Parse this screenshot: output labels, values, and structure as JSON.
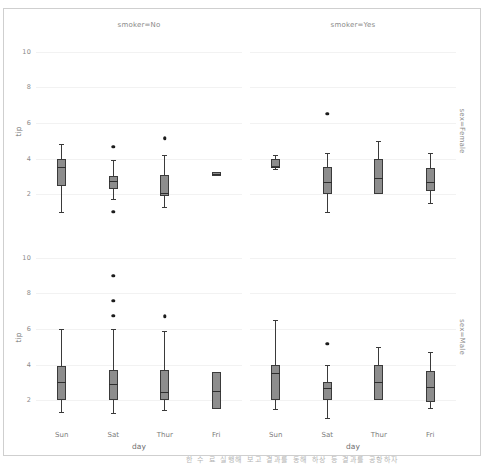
{
  "figure": {
    "background_color": "#ffffff",
    "frame_color": "#cfcfcf",
    "grid_color": "#f2f2f2",
    "box_fill_color": "#8d8d8d",
    "box_edge_color": "#3a3a3a",
    "flier_color": "#1c1c1c",
    "bottom_caption": "한 수 료 실행해 보고 결과를 동해 하상 등 결과를 공항하자"
  },
  "axis": {
    "ylabel": "tip",
    "xlabel": "day",
    "yticks": [
      "10",
      "8",
      "6",
      "4",
      "2"
    ],
    "ytick_values": [
      10,
      8,
      6,
      4,
      2
    ],
    "ylim": [
      0.6,
      11.0
    ],
    "xticks": [
      "Sun",
      "Sat",
      "Thur",
      "Fri"
    ]
  },
  "panels": [
    {
      "id": "no-female",
      "col_title": "smoker=No",
      "row_label": "sex=Female",
      "show_col_title": true,
      "show_row_label": true,
      "show_ylabel": true,
      "show_xticks": false,
      "show_xlabel": false
    },
    {
      "id": "yes-female",
      "col_title": "smoker=Yes",
      "row_label": "sex=Female",
      "show_col_title": true,
      "show_row_label": true,
      "show_ylabel": false,
      "show_xticks": false,
      "show_xlabel": false
    },
    {
      "id": "no-male",
      "col_title": "smoker=No",
      "row_label": "sex=Male",
      "show_col_title": false,
      "show_row_label": true,
      "show_ylabel": true,
      "show_xticks": true,
      "show_xlabel": true
    },
    {
      "id": "yes-male",
      "col_title": "smoker=Yes",
      "row_label": "sex=Male",
      "show_col_title": false,
      "show_row_label": true,
      "show_ylabel": false,
      "show_xticks": true,
      "show_xlabel": true
    }
  ],
  "chart_data": {
    "type": "box",
    "title": "",
    "xlabel": "day",
    "ylabel": "tip",
    "ylim": [
      0.6,
      11.0
    ],
    "yticks": [
      2,
      4,
      6,
      8,
      10
    ],
    "grid": true,
    "legend": "none",
    "facet_rows": [
      "sex=Female",
      "sex=Male"
    ],
    "facet_cols": [
      "smoker=No",
      "smoker=Yes"
    ],
    "categories": [
      "Sun",
      "Sat",
      "Thur",
      "Fri"
    ],
    "panels": [
      {
        "row": "sex=Female",
        "col": "smoker=No",
        "boxes": [
          {
            "category": "Sun",
            "whisker_low": 1.01,
            "q1": 2.45,
            "median": 3.5,
            "q3": 4.0,
            "whisker_high": 4.8,
            "fliers": []
          },
          {
            "category": "Sat",
            "whisker_low": 1.75,
            "q1": 2.3,
            "median": 2.75,
            "q3": 3.0,
            "whisker_high": 3.9,
            "fliers": [
              4.67,
              1.0
            ]
          },
          {
            "category": "Thur",
            "whisker_low": 1.25,
            "q1": 1.9,
            "median": 2.05,
            "q3": 3.05,
            "whisker_high": 4.2,
            "fliers": [
              5.1,
              5.17
            ]
          },
          {
            "category": "Fri",
            "whisker_low": 3.0,
            "q1": 3.0,
            "median": 3.12,
            "q3": 3.25,
            "whisker_high": 3.25,
            "fliers": []
          }
        ]
      },
      {
        "row": "sex=Female",
        "col": "smoker=Yes",
        "boxes": [
          {
            "category": "Sun",
            "whisker_low": 3.4,
            "q1": 3.5,
            "median": 3.5,
            "q3": 3.95,
            "whisker_high": 4.2,
            "fliers": []
          },
          {
            "category": "Sat",
            "whisker_low": 1.0,
            "q1": 2.0,
            "median": 2.68,
            "q3": 3.5,
            "whisker_high": 4.3,
            "fliers": [
              6.5
            ]
          },
          {
            "category": "Thur",
            "whisker_low": 2.0,
            "q1": 2.0,
            "median": 2.88,
            "q3": 4.0,
            "whisker_high": 5.0,
            "fliers": []
          },
          {
            "category": "Fri",
            "whisker_low": 1.5,
            "q1": 2.2,
            "median": 2.68,
            "q3": 3.48,
            "whisker_high": 4.3,
            "fliers": []
          }
        ]
      },
      {
        "row": "sex=Male",
        "col": "smoker=No",
        "boxes": [
          {
            "category": "Sun",
            "whisker_low": 1.32,
            "q1": 2.0,
            "median": 3.02,
            "q3": 3.9,
            "whisker_high": 6.0,
            "fliers": []
          },
          {
            "category": "Sat",
            "whisker_low": 1.25,
            "q1": 2.0,
            "median": 2.9,
            "q3": 3.68,
            "whisker_high": 6.0,
            "fliers": [
              9.0,
              7.58,
              6.73
            ]
          },
          {
            "category": "Thur",
            "whisker_low": 1.44,
            "q1": 2.0,
            "median": 2.45,
            "q3": 3.68,
            "whisker_high": 5.9,
            "fliers": [
              6.7
            ]
          },
          {
            "category": "Fri",
            "whisker_low": 1.5,
            "q1": 1.5,
            "median": 2.5,
            "q3": 3.58,
            "whisker_high": 3.58,
            "fliers": []
          }
        ]
      },
      {
        "row": "sex=Male",
        "col": "smoker=Yes",
        "boxes": [
          {
            "category": "Sun",
            "whisker_low": 1.5,
            "q1": 2.0,
            "median": 3.5,
            "q3": 4.0,
            "whisker_high": 6.5,
            "fliers": []
          },
          {
            "category": "Sat",
            "whisker_low": 1.0,
            "q1": 2.0,
            "median": 2.69,
            "q3": 3.0,
            "whisker_high": 4.0,
            "fliers": [
              5.15
            ]
          },
          {
            "category": "Thur",
            "whisker_low": 2.0,
            "q1": 2.0,
            "median": 3.0,
            "q3": 4.0,
            "whisker_high": 5.0,
            "fliers": []
          },
          {
            "category": "Fri",
            "whisker_low": 1.58,
            "q1": 1.9,
            "median": 2.75,
            "q3": 3.65,
            "whisker_high": 4.73,
            "fliers": []
          }
        ]
      }
    ]
  }
}
